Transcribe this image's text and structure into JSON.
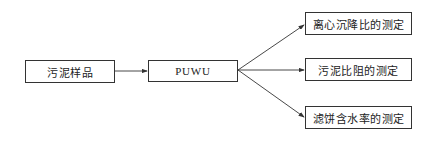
{
  "diagram": {
    "type": "flowchart",
    "nodes": [
      {
        "id": "sample",
        "label": "污泥样品"
      },
      {
        "id": "puwu",
        "label": "PUWU"
      },
      {
        "id": "centrifugal",
        "label": "离心沉降比的测定"
      },
      {
        "id": "resistance",
        "label": "污泥比阻的测定"
      },
      {
        "id": "moisture",
        "label": "滤饼含水率的测定"
      }
    ],
    "edges": [
      {
        "from": "sample",
        "to": "puwu"
      },
      {
        "from": "puwu",
        "to": "centrifugal"
      },
      {
        "from": "puwu",
        "to": "resistance"
      },
      {
        "from": "puwu",
        "to": "moisture"
      }
    ]
  },
  "colors": {
    "line": "#333333",
    "background": "#ffffff"
  }
}
